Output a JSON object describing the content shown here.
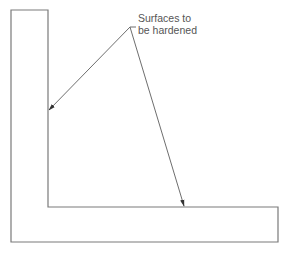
{
  "diagram": {
    "title": "",
    "annotation": {
      "lines": [
        "Surfaces to",
        "be hardened"
      ]
    },
    "colors": {
      "outline": "#7a7a7a",
      "leader": "#6e6e6e",
      "arrowhead": "#333333",
      "text": "#555555",
      "background": "#ffffff"
    },
    "shape": {
      "type": "L-section",
      "points": [
        [
          11,
          10
        ],
        [
          48,
          10
        ],
        [
          48,
          207
        ],
        [
          278,
          207
        ],
        [
          278,
          242
        ],
        [
          11,
          242
        ]
      ]
    },
    "leaders": [
      {
        "from": [
          130,
          27
        ],
        "to": [
          48,
          111
        ],
        "target": "inner vertical surface"
      },
      {
        "from": [
          130,
          27
        ],
        "to": [
          184,
          207
        ],
        "target": "inner horizontal surface"
      }
    ]
  }
}
